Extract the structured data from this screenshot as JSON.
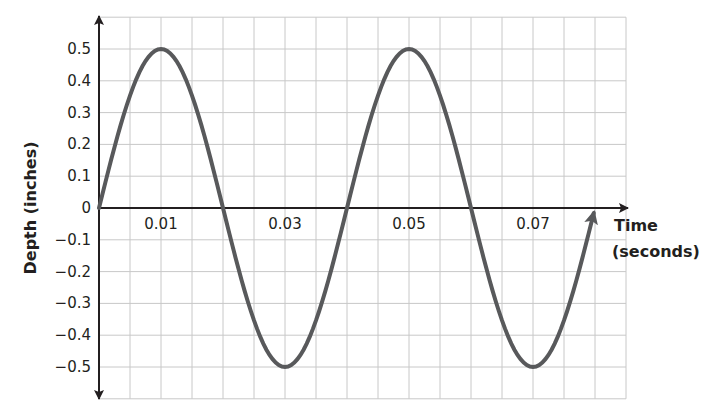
{
  "chart_data": {
    "type": "line",
    "title": "",
    "xlabel": "Time (seconds)",
    "xlabel_lines": [
      "Time",
      "(seconds)"
    ],
    "ylabel": "Depth (inches)",
    "x_tick_labels": [
      "0.01",
      "0.03",
      "0.05",
      "0.07"
    ],
    "x_ticks": [
      0.01,
      0.03,
      0.05,
      0.07
    ],
    "y_tick_labels": [
      "0.5",
      "0.4",
      "0.3",
      "0.2",
      "0.1",
      "0",
      "−0.1",
      "−0.2",
      "−0.3",
      "−0.4",
      "−0.5"
    ],
    "y_ticks": [
      0.5,
      0.4,
      0.3,
      0.2,
      0.1,
      0,
      -0.1,
      -0.2,
      -0.3,
      -0.4,
      -0.5
    ],
    "xlim": [
      0,
      0.085
    ],
    "ylim": [
      -0.6,
      0.6
    ],
    "grid": true,
    "grid_x_step": 0.005,
    "grid_y_step": 0.1,
    "legend": null,
    "series": [
      {
        "name": "Depth",
        "function": "0.5*sin(2*pi*t/0.04)",
        "amplitude": 0.5,
        "period": 0.04,
        "x": [
          0,
          0.005,
          0.01,
          0.015,
          0.02,
          0.025,
          0.03,
          0.035,
          0.04,
          0.045,
          0.05,
          0.055,
          0.06,
          0.065,
          0.07,
          0.075,
          0.08
        ],
        "y": [
          0,
          0.354,
          0.5,
          0.354,
          0,
          -0.354,
          -0.5,
          -0.354,
          0,
          0.354,
          0.5,
          0.354,
          0,
          -0.354,
          -0.5,
          -0.354,
          0
        ],
        "color": "#58595b",
        "end_arrow": true
      }
    ],
    "annotations": []
  },
  "colors": {
    "curve": "#58595b",
    "axis": "#231f20",
    "grid": "#c8c8c8",
    "text": "#231f20"
  }
}
